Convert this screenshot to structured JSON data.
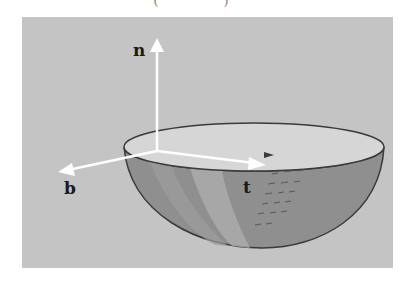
{
  "caption": {
    "text": "( )"
  },
  "diagram": {
    "colors": {
      "background": "#c4c4c4",
      "bowl_inner": "#d4d4d4",
      "bowl_outer": "#8f8f8f",
      "bowl_highlight": "#a8a8a8",
      "arrows": "#ffffff",
      "outline": "#3a3a3a"
    },
    "vectors": [
      {
        "id": "n",
        "label": "n",
        "meaning": "normal"
      },
      {
        "id": "b",
        "label": "b",
        "meaning": "binormal"
      },
      {
        "id": "t",
        "label": "t",
        "meaning": "tangent"
      }
    ]
  }
}
